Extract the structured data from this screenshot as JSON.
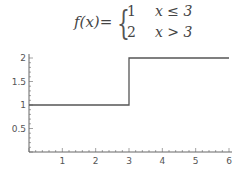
{
  "formula": {
    "lhs": "f(x)=",
    "cases": [
      {
        "value": "1",
        "condition": "x ≤ 3"
      },
      {
        "value": "2",
        "condition": "x > 3"
      }
    ]
  },
  "chart_data": {
    "type": "line",
    "title": "",
    "xlabel": "",
    "ylabel": "",
    "xlim": [
      0,
      6
    ],
    "ylim": [
      0,
      2
    ],
    "grid": false,
    "series": [
      {
        "name": "f(x)",
        "step": true,
        "x": [
          0,
          3,
          3,
          6
        ],
        "y": [
          1,
          1,
          2,
          2
        ]
      }
    ],
    "x_ticks": [
      1,
      2,
      3,
      4,
      5,
      6
    ],
    "x_tick_labels": [
      "1",
      "2",
      "3",
      "4",
      "5",
      "6"
    ],
    "y_ticks": [
      0.5,
      1,
      1.5,
      2
    ],
    "y_tick_labels": [
      "0.5",
      "1",
      "1.5",
      "2"
    ],
    "colors": {
      "line": "#555555",
      "axis": "#666666"
    }
  }
}
